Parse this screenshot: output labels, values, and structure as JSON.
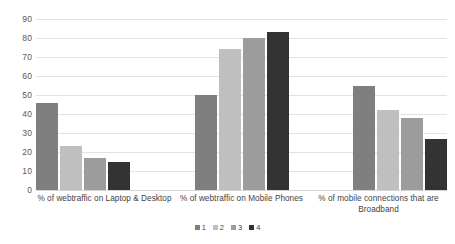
{
  "chart_data": {
    "type": "bar",
    "title": "",
    "subtitle": "",
    "xlabel": "",
    "ylabel": "",
    "ylim": [
      0,
      90
    ],
    "ytick_step": 10,
    "yticks": [
      "90",
      "80",
      "70",
      "60",
      "50",
      "40",
      "30",
      "20",
      "10",
      "0"
    ],
    "grid": true,
    "legend_position": "bottom-center",
    "categories": [
      "% of webtraffic on Laptop & Desktop",
      "% of webtraffic on Mobile Phones",
      "% of mobile connections that are Broadband"
    ],
    "series": [
      {
        "name": "1",
        "color": "#7f7f7f",
        "values": [
          46,
          50,
          55
        ]
      },
      {
        "name": "2",
        "color": "#bfbfbf",
        "values": [
          23,
          74,
          42
        ]
      },
      {
        "name": "3",
        "color": "#9c9c9c",
        "values": [
          17,
          80,
          38
        ]
      },
      {
        "name": "4",
        "color": "#333333",
        "values": [
          15,
          83,
          27
        ]
      }
    ]
  },
  "legend": {
    "items": [
      {
        "label": "1",
        "color": "#7f7f7f"
      },
      {
        "label": "2",
        "color": "#bfbfbf"
      },
      {
        "label": "3",
        "color": "#9c9c9c"
      },
      {
        "label": "4",
        "color": "#333333"
      }
    ]
  },
  "colors": {
    "series1": "#7f7f7f",
    "series2": "#bfbfbf",
    "series3": "#9c9c9c",
    "series4": "#333333",
    "gridline": "#e2e2e2",
    "text": "#404040",
    "background": "#ffffff"
  }
}
